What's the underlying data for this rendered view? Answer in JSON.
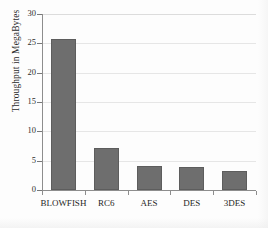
{
  "chart_data": {
    "type": "bar",
    "title": "",
    "xlabel": "",
    "ylabel": "Throughput in MegaBytes",
    "categories": [
      "BLOWFISH",
      "RC6",
      "AES",
      "DES",
      "3DES"
    ],
    "values": [
      25.8,
      7.1,
      4.1,
      3.9,
      3.3
    ],
    "ylim": [
      0,
      30
    ],
    "ytick_labels": [
      "0",
      "5",
      "10",
      "15",
      "20",
      "25",
      "30"
    ],
    "ytick_values": [
      0,
      5,
      10,
      15,
      20,
      25,
      30
    ],
    "grid": true,
    "legend": false,
    "bar_color": "#6e6e6e",
    "gridline_color": "#e6e6e6",
    "axis_color": "#8d8d8d",
    "background_color": "#fdfdfd"
  }
}
